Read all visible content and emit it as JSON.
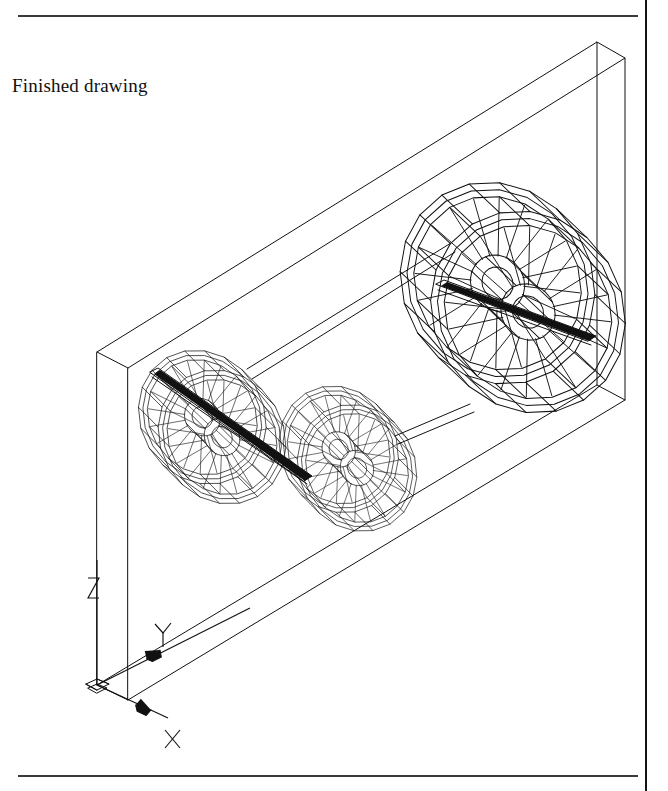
{
  "page": {
    "width": 668,
    "height": 791,
    "background": "#ffffff",
    "ink": "#111111",
    "rule_color": "#3a3a3a"
  },
  "caption": {
    "text": "Finished drawing"
  },
  "rules": {
    "top_label": "top-horizontal-rule",
    "bottom_label": "bottom-horizontal-rule",
    "gutter_label": "page-gutter-line"
  },
  "drawing": {
    "title": "3D wireframe of a belt-and-pulley assembly inside a thin rectangular slab",
    "ucs_icon": {
      "z_label": "Z",
      "y_label": "Y",
      "x_label": "X",
      "origin_x": 97,
      "origin_y": 685
    },
    "slab": {
      "description": "thin rectangular plate shown in isometric view",
      "front_face": [
        [
          128,
          368
        ],
        [
          625,
          58
        ],
        [
          625,
          400
        ],
        [
          128,
          700
        ]
      ],
      "back_face": [
        [
          97,
          352
        ],
        [
          597,
          42
        ],
        [
          597,
          385
        ],
        [
          97,
          685
        ]
      ]
    },
    "pulleys": [
      {
        "name": "pulley-left",
        "cx": 222,
        "cy": 437,
        "r": 66,
        "spokes": 18
      },
      {
        "name": "pulley-middle",
        "cx": 357,
        "cy": 468,
        "r": 62,
        "spokes": 18
      },
      {
        "name": "pulley-right",
        "cx": 528,
        "cy": 312,
        "r": 100,
        "spokes": 20
      }
    ],
    "shafts": [
      {
        "name": "shaft-left",
        "from": [
          152,
          375
        ],
        "to": [
          300,
          470
        ]
      },
      {
        "name": "shaft-right",
        "from": [
          440,
          288
        ],
        "to": [
          592,
          340
        ]
      }
    ],
    "belts": [
      {
        "name": "belt-upper",
        "from": [
          248,
          368
        ],
        "to": [
          452,
          246
        ]
      },
      {
        "name": "belt-lower",
        "from": [
          398,
          438
        ],
        "to": [
          468,
          406
        ]
      }
    ]
  }
}
